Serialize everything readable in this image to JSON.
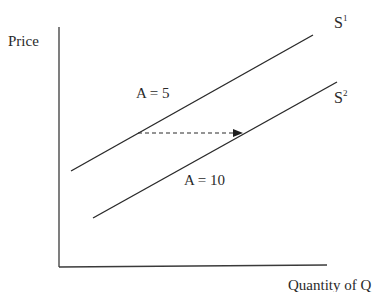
{
  "diagram": {
    "type": "supply-shift",
    "y_axis_label": "Price",
    "x_axis_label": "Quantity of Q",
    "curves": [
      {
        "name": "S",
        "superscript": "1",
        "param_label": "A = 5",
        "from": [
          71,
          171
        ],
        "to": [
          313,
          35
        ]
      },
      {
        "name": "S",
        "superscript": "2",
        "param_label": "A = 10",
        "from": [
          93,
          218
        ],
        "to": [
          337,
          82
        ]
      }
    ],
    "shift_arrow": {
      "style": "dashed",
      "from": [
        138,
        133
      ],
      "to": [
        242,
        133
      ],
      "direction": "right"
    },
    "colors": {
      "line": "#2a2a2a",
      "background": "#ffffff"
    }
  }
}
